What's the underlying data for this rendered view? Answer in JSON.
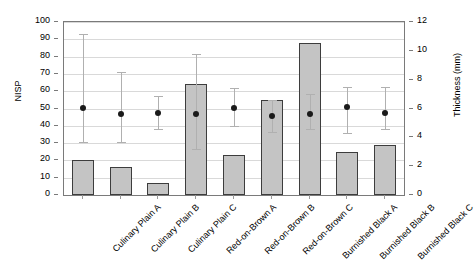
{
  "chart_data": {
    "type": "bar",
    "title": "",
    "xlabel": "",
    "ylabel": "NISP",
    "y2label": "Thickness (mm)",
    "ylim": [
      0,
      100
    ],
    "y2lim": [
      0,
      12
    ],
    "yticks": [
      0,
      10,
      20,
      30,
      40,
      50,
      60,
      70,
      80,
      90,
      100
    ],
    "y2ticks": [
      0,
      2,
      4,
      6,
      8,
      10,
      12
    ],
    "grid": true,
    "legend": "none",
    "categories": [
      "Culinary Plain A",
      "Culinary Plain B",
      "Culinary Plain C",
      "Red-on-Brown A",
      "Red-on-Brown B",
      "Red-on-Brown C",
      "Burnished Black A",
      "Burnished Black B",
      "Burnished Black C"
    ],
    "series": [
      {
        "name": "NISP",
        "type": "bar",
        "axis": "left",
        "color": "#c4c4c4",
        "values": [
          20,
          16,
          7,
          64,
          23,
          55,
          88,
          25,
          29
        ]
      },
      {
        "name": "Thickness (mm)",
        "type": "scatter",
        "axis": "right",
        "color": "#1a1a1a",
        "values": [
          6.05,
          5.6,
          5.7,
          5.65,
          6.05,
          5.5,
          5.65,
          6.1,
          5.7
        ],
        "error_low": [
          3.7,
          3.7,
          4.6,
          3.2,
          4.8,
          4.4,
          4.6,
          4.3,
          4.6
        ],
        "error_high": [
          11.2,
          8.5,
          6.9,
          9.8,
          7.4,
          6.6,
          7.0,
          7.5,
          7.5
        ]
      }
    ]
  }
}
